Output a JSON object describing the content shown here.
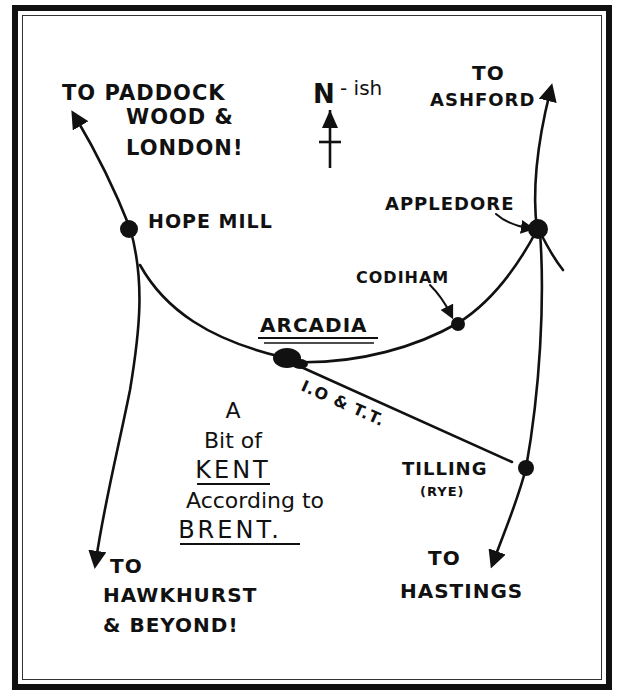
{
  "map": {
    "title_lines": [
      "A",
      "Bit of",
      "KENT",
      "According to",
      "BRENT."
    ],
    "compass": {
      "label": "N",
      "suffix": "- ish"
    },
    "destinations": {
      "northwest": [
        "TO PADDOCK",
        "WOOD &",
        "LONDON!"
      ],
      "northeast": [
        "TO",
        "ASHFORD"
      ],
      "southwest": [
        "TO",
        "HAWKHURST",
        "& BEYOND!"
      ],
      "southeast": [
        "TO",
        "HASTINGS"
      ]
    },
    "places": {
      "hope_mill": "HOPE MILL",
      "appledore": "APPLEDORE",
      "codiham": "CODIHAM",
      "arcadia": "ARCADIA",
      "tilling": "TILLING",
      "tilling_alt": "(RYE)"
    },
    "road_labels": {
      "arcadia_tilling": "I.O & T.T."
    },
    "colors": {
      "ink": "#111111",
      "paper": "#ffffff"
    }
  }
}
